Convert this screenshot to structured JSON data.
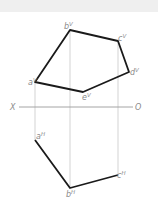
{
  "diagram": {
    "type": "orthographic-projection",
    "axis": {
      "left_label": "X",
      "right_label": "O"
    },
    "colors": {
      "edge": "#1a1a1a",
      "construction": "#c8c8c8",
      "axis": "#9a9a9a",
      "label": "#8a8a8a",
      "band": "#efefef"
    },
    "vertical_projection": {
      "points": [
        {
          "name": "a",
          "sup": "V",
          "x": 35,
          "y": 82
        },
        {
          "name": "b",
          "sup": "V",
          "x": 70,
          "y": 30
        },
        {
          "name": "c",
          "sup": "V",
          "x": 118,
          "y": 41
        },
        {
          "name": "d",
          "sup": "V",
          "x": 129,
          "y": 72
        },
        {
          "name": "e",
          "sup": "V",
          "x": 83,
          "y": 92
        }
      ]
    },
    "horizontal_projection": {
      "points": [
        {
          "name": "a",
          "sup": "H",
          "x": 35,
          "y": 140
        },
        {
          "name": "b",
          "sup": "H",
          "x": 70,
          "y": 188
        },
        {
          "name": "c",
          "sup": "H",
          "x": 118,
          "y": 175
        }
      ]
    },
    "labels": {
      "aV": "a",
      "aV_sup": "V",
      "bV": "b",
      "bV_sup": "V",
      "cV": "c",
      "cV_sup": "V",
      "dV": "d",
      "dV_sup": "V",
      "eV": "e",
      "eV_sup": "V",
      "aH": "a",
      "aH_sup": "H",
      "bH": "b",
      "bH_sup": "H",
      "cH": "c",
      "cH_sup": "H"
    }
  }
}
